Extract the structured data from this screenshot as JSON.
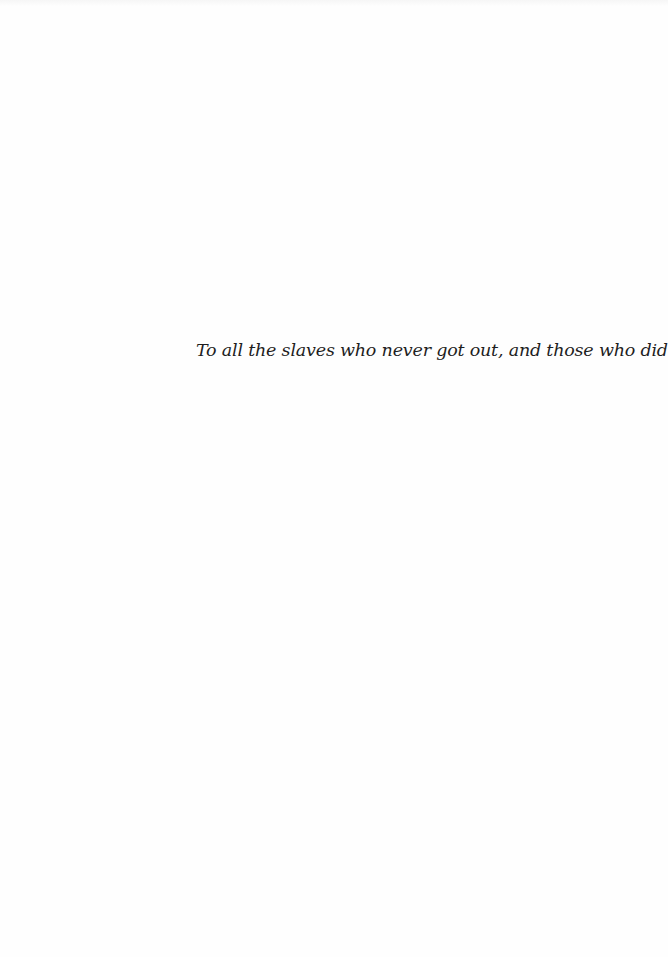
{
  "page": {
    "type": "dedication",
    "dedication_text": "To all the slaves who never got out, and those who did"
  }
}
